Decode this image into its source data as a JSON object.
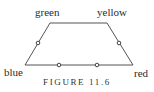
{
  "figure": {
    "caption": "FIGURE 11.6",
    "stroke_color": "#555555",
    "dot_color": "#444444",
    "vertices": [
      {
        "id": "green",
        "label": "green",
        "x": 50,
        "y": 23
      },
      {
        "id": "yellow",
        "label": "yellow",
        "x": 107,
        "y": 23
      },
      {
        "id": "red",
        "label": "red",
        "x": 133,
        "y": 65
      },
      {
        "id": "blue",
        "label": "blue",
        "x": 25,
        "y": 65
      }
    ],
    "edge_points": [
      {
        "edge": "blue-green",
        "x": 38,
        "y": 43
      },
      {
        "edge": "yellow-red",
        "x": 119,
        "y": 43
      },
      {
        "edge": "blue-red",
        "x": 59,
        "y": 64
      },
      {
        "edge": "blue-red",
        "x": 97,
        "y": 64
      }
    ]
  }
}
